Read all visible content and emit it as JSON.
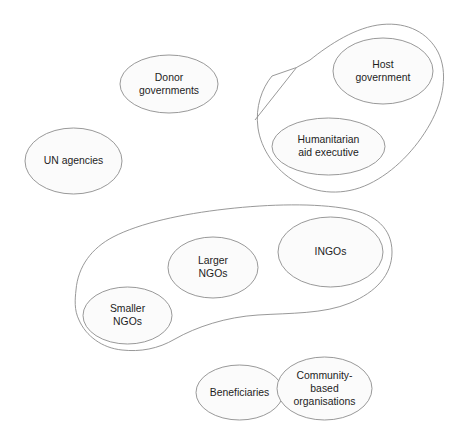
{
  "diagram": {
    "type": "venn-cluster-diagram",
    "background_color": "#ffffff",
    "shape_fill_color": "#fbfbfb",
    "shape_stroke_color": "#8d8d8d",
    "text_color": "#1d1d1d",
    "nodes": [
      {
        "id": "un-agencies",
        "label": "UN agencies",
        "lines": [
          "UN agencies"
        ],
        "shape": "ellipse",
        "cx": 73.5,
        "cy": 161,
        "rx": 48.5,
        "ry": 33,
        "group": null
      },
      {
        "id": "donor-governments",
        "label": "Donor governments",
        "lines": [
          "Donor",
          "governments"
        ],
        "shape": "ellipse",
        "cx": 169,
        "cy": 84,
        "rx": 49,
        "ry": 29,
        "group": null
      },
      {
        "id": "host-government",
        "label": "Host government",
        "lines": [
          "Host",
          "government"
        ],
        "shape": "ellipse",
        "cx": 383,
        "cy": 71,
        "rx": 50,
        "ry": 33,
        "group": "government-executive-group"
      },
      {
        "id": "humanitarian-aid-executive",
        "label": "Humanitarian aid executive",
        "lines": [
          "Humanitarian",
          "aid executive"
        ],
        "shape": "ellipse",
        "cx": 328.5,
        "cy": 146.5,
        "rx": 56.5,
        "ry": 28.5,
        "group": "government-executive-group"
      },
      {
        "id": "larger-ngos",
        "label": "Larger NGOs",
        "lines": [
          "Larger",
          "NGOs"
        ],
        "shape": "ellipse",
        "cx": 213,
        "cy": 267.5,
        "rx": 45,
        "ry": 30.5,
        "group": "ngo-group"
      },
      {
        "id": "ingos",
        "label": "INGOs",
        "lines": [
          "INGOs"
        ],
        "shape": "ellipse",
        "cx": 330.5,
        "cy": 252,
        "rx": 52.5,
        "ry": 35,
        "group": "ngo-group"
      },
      {
        "id": "smaller-ngos",
        "label": "Smaller NGOs",
        "lines": [
          "Smaller",
          "NGOs"
        ],
        "shape": "ellipse",
        "cx": 127.5,
        "cy": 315.5,
        "rx": 44.5,
        "ry": 28.5,
        "group": "ngo-group"
      },
      {
        "id": "beneficiaries",
        "label": "Beneficiaries",
        "lines": [
          "Beneficiaries"
        ],
        "shape": "ellipse",
        "cx": 239.5,
        "cy": 392.5,
        "rx": 43.5,
        "ry": 27.5,
        "group": null
      },
      {
        "id": "community-based-organisations",
        "label": "Community-based organisations",
        "lines": [
          "Community-",
          "based",
          "organisations"
        ],
        "shape": "ellipse",
        "cx": 324.5,
        "cy": 388.5,
        "rx": 47.5,
        "ry": 31.5,
        "group": null
      }
    ],
    "groups": [
      {
        "id": "government-executive-group",
        "label": "",
        "description": "Enclosure around Host government and Humanitarian aid executive",
        "members": [
          "host-government",
          "humanitarian-aid-executive"
        ]
      },
      {
        "id": "ngo-group",
        "label": "",
        "description": "Enclosure around Larger NGOs, INGOs and Smaller NGOs",
        "members": [
          "larger-ngos",
          "ingos",
          "smaller-ngos"
        ]
      }
    ]
  }
}
